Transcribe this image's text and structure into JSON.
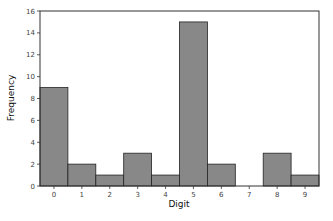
{
  "chart_data": {
    "type": "bar",
    "title": "",
    "xlabel": "Digit",
    "ylabel": "Frequency",
    "categories": [
      "0",
      "1",
      "2",
      "3",
      "4",
      "5",
      "6",
      "7",
      "8",
      "9"
    ],
    "values": [
      9,
      2,
      1,
      3,
      1,
      15,
      2,
      0,
      3,
      1
    ],
    "ylim": [
      0,
      16
    ],
    "yticks": [
      0,
      2,
      4,
      6,
      8,
      10,
      12,
      14,
      16
    ],
    "grid": false,
    "legend": null,
    "bar_color": "#888888",
    "bar_edge_color": "#222222",
    "histogram": true
  }
}
